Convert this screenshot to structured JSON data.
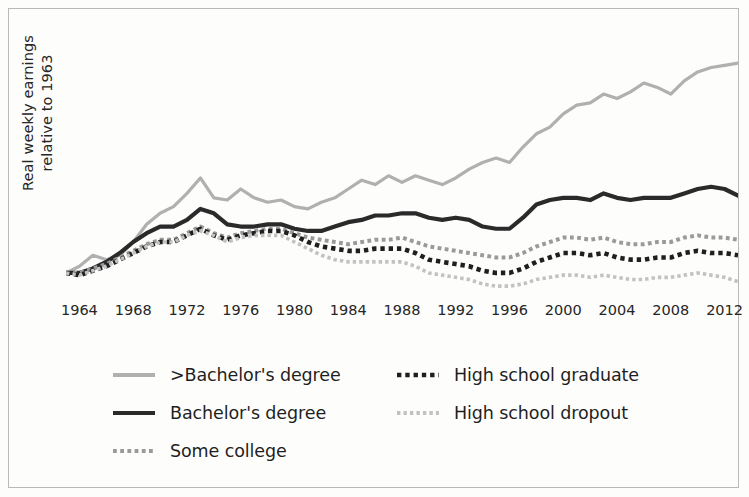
{
  "chart_data": {
    "type": "line",
    "title": "",
    "subtitle": "",
    "xlabel": "",
    "ylabel": "Real weekly earnings relative to 1963",
    "ylabel_lines": [
      "Real weekly earnings",
      "relative to 1963"
    ],
    "grid": false,
    "legend_position": "bottom",
    "xlim": [
      1963,
      2013
    ],
    "ylim": [
      0.9,
      2.1
    ],
    "xticks": [
      1964,
      1968,
      1972,
      1976,
      1980,
      1984,
      1988,
      1992,
      1996,
      2000,
      2004,
      2008,
      2012
    ],
    "xtick_labels": [
      "1964",
      "1968",
      "1972",
      "1976",
      "1980",
      "1984",
      "1988",
      "1992",
      "1996",
      "2000",
      "2004",
      "2008",
      "2012"
    ],
    "yticks": [],
    "ytick_labels": [],
    "x": [
      1963,
      1964,
      1965,
      1966,
      1967,
      1968,
      1969,
      1970,
      1971,
      1972,
      1973,
      1974,
      1975,
      1976,
      1977,
      1978,
      1979,
      1980,
      1981,
      1982,
      1983,
      1984,
      1985,
      1986,
      1987,
      1988,
      1989,
      1990,
      1991,
      1992,
      1993,
      1994,
      1995,
      1996,
      1997,
      1998,
      1999,
      2000,
      2001,
      2002,
      2003,
      2004,
      2005,
      2006,
      2007,
      2008,
      2009,
      2010,
      2011,
      2012,
      2013
    ],
    "series": [
      {
        "name": ">Bachelor's degree",
        "color": "#b0b0b0",
        "style": "solid",
        "width": 3.2,
        "values": [
          1.0,
          1.03,
          1.08,
          1.06,
          1.08,
          1.14,
          1.22,
          1.27,
          1.3,
          1.36,
          1.43,
          1.34,
          1.33,
          1.38,
          1.34,
          1.32,
          1.33,
          1.3,
          1.29,
          1.32,
          1.34,
          1.38,
          1.42,
          1.4,
          1.44,
          1.41,
          1.44,
          1.42,
          1.4,
          1.43,
          1.47,
          1.5,
          1.52,
          1.5,
          1.57,
          1.63,
          1.66,
          1.72,
          1.76,
          1.77,
          1.81,
          1.79,
          1.82,
          1.86,
          1.84,
          1.81,
          1.87,
          1.91,
          1.93,
          1.94,
          1.95
        ]
      },
      {
        "name": "Bachelor's degree",
        "color": "#2a2a2a",
        "style": "solid",
        "width": 4.2,
        "values": [
          1.0,
          1.0,
          1.02,
          1.05,
          1.09,
          1.14,
          1.18,
          1.21,
          1.21,
          1.24,
          1.29,
          1.27,
          1.22,
          1.21,
          1.21,
          1.22,
          1.22,
          1.2,
          1.19,
          1.19,
          1.21,
          1.23,
          1.24,
          1.26,
          1.26,
          1.27,
          1.27,
          1.25,
          1.24,
          1.25,
          1.24,
          1.21,
          1.2,
          1.2,
          1.25,
          1.31,
          1.33,
          1.34,
          1.34,
          1.33,
          1.36,
          1.34,
          1.33,
          1.34,
          1.34,
          1.34,
          1.36,
          1.38,
          1.39,
          1.38,
          1.35
        ]
      },
      {
        "name": "Some college",
        "color": "#9a9a9a",
        "style": "dotted",
        "width": 4.0,
        "values": [
          1.0,
          1.0,
          1.02,
          1.04,
          1.07,
          1.1,
          1.13,
          1.15,
          1.15,
          1.18,
          1.21,
          1.18,
          1.16,
          1.18,
          1.19,
          1.2,
          1.2,
          1.18,
          1.16,
          1.15,
          1.14,
          1.13,
          1.14,
          1.15,
          1.15,
          1.16,
          1.14,
          1.12,
          1.11,
          1.1,
          1.09,
          1.08,
          1.07,
          1.07,
          1.09,
          1.12,
          1.14,
          1.16,
          1.16,
          1.15,
          1.16,
          1.14,
          1.13,
          1.13,
          1.14,
          1.14,
          1.16,
          1.17,
          1.16,
          1.16,
          1.15
        ]
      },
      {
        "name": "High school graduate",
        "color": "#1f1f1f",
        "style": "dotted",
        "width": 4.6,
        "values": [
          1.0,
          0.99,
          1.01,
          1.03,
          1.06,
          1.09,
          1.12,
          1.14,
          1.14,
          1.17,
          1.2,
          1.17,
          1.15,
          1.17,
          1.18,
          1.19,
          1.19,
          1.17,
          1.14,
          1.12,
          1.11,
          1.1,
          1.1,
          1.11,
          1.11,
          1.11,
          1.09,
          1.06,
          1.05,
          1.04,
          1.03,
          1.01,
          1.0,
          1.0,
          1.02,
          1.05,
          1.07,
          1.09,
          1.09,
          1.08,
          1.09,
          1.07,
          1.06,
          1.06,
          1.07,
          1.07,
          1.09,
          1.1,
          1.09,
          1.09,
          1.08
        ]
      },
      {
        "name": "High school dropout",
        "color": "#c2c2c2",
        "style": "dotted",
        "width": 3.6,
        "values": [
          1.0,
          0.99,
          1.01,
          1.03,
          1.06,
          1.09,
          1.12,
          1.14,
          1.14,
          1.17,
          1.19,
          1.17,
          1.14,
          1.16,
          1.17,
          1.17,
          1.17,
          1.14,
          1.11,
          1.08,
          1.06,
          1.05,
          1.05,
          1.05,
          1.05,
          1.05,
          1.03,
          1.0,
          0.99,
          0.98,
          0.97,
          0.95,
          0.94,
          0.94,
          0.95,
          0.97,
          0.98,
          0.99,
          0.99,
          0.98,
          0.99,
          0.98,
          0.97,
          0.97,
          0.98,
          0.98,
          0.99,
          1.0,
          0.99,
          0.98,
          0.96
        ]
      }
    ]
  },
  "legend": {
    "items": [
      {
        "label": ">Bachelor's degree",
        "series_index": 0
      },
      {
        "label": "Bachelor's degree",
        "series_index": 1
      },
      {
        "label": "Some college",
        "series_index": 2
      },
      {
        "label": "High school graduate",
        "series_index": 3
      },
      {
        "label": "High school dropout",
        "series_index": 4
      }
    ]
  },
  "colors": {
    "frame_border": "#b9b9b9",
    "background": "#fdfdfc",
    "text": "#262626"
  }
}
